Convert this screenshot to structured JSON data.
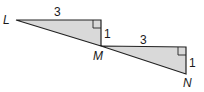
{
  "diagram": {
    "type": "geometry",
    "fill_color": "#d9d9d9",
    "stroke_color": "#222222",
    "points": {
      "L": "L",
      "M": "M",
      "N": "N"
    },
    "triangle_left": {
      "leg_horizontal": "3",
      "leg_vertical": "1",
      "right_angle": true
    },
    "triangle_right": {
      "leg_horizontal": "3",
      "leg_vertical": "1",
      "right_angle": true
    }
  }
}
